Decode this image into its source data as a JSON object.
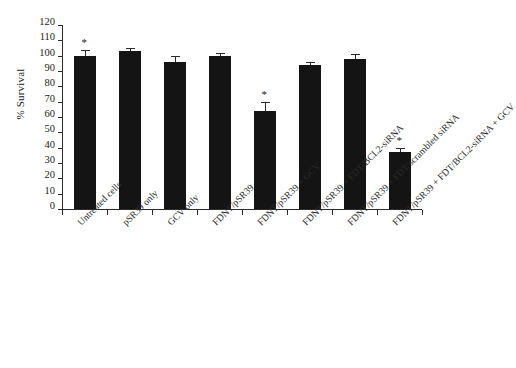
{
  "chart_data": {
    "type": "bar",
    "title": "",
    "xlabel": "",
    "ylabel": "% Survival",
    "ylim": [
      0,
      120
    ],
    "ytick_step": 10,
    "yticks": [
      120,
      110,
      100,
      90,
      80,
      70,
      60,
      50,
      40,
      30,
      20,
      10,
      0
    ],
    "grid": false,
    "legend": null,
    "bar_color": "#141414",
    "axis_color": "#2b2b2b",
    "categories": [
      "Untreated cells",
      "pSR39 only",
      "GCV only",
      "FDNT/pSR39",
      "FDNT/pSR39 + GCV",
      "FDNT/pSR39 + FDT/BCL2-siRNA",
      "FDNT/pSR39 + FDT/scrambled siRNA",
      "FDNT/pSR39 + FDT/BCL2-siRNA + GCV"
    ],
    "values": [
      100,
      103,
      96,
      100,
      64,
      94,
      98,
      37
    ],
    "errors": [
      4,
      2,
      4,
      2,
      6,
      2,
      3,
      3
    ],
    "significance_markers": [
      {
        "index": 0,
        "symbol": "*"
      },
      {
        "index": 4,
        "symbol": "*"
      },
      {
        "index": 7,
        "symbol": "*"
      }
    ]
  }
}
